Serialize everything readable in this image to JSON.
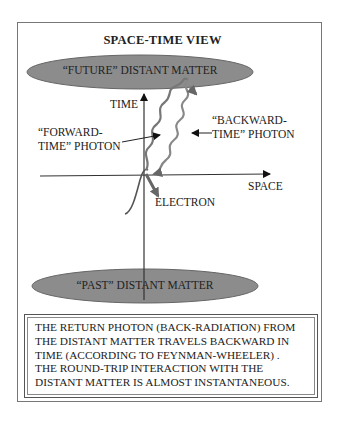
{
  "title": "SPACE-TIME VIEW",
  "ellipses": {
    "future": {
      "label": "“FUTURE” DISTANT MATTER",
      "fill": "#8c8c8c"
    },
    "past": {
      "label": "“PAST” DISTANT MATTER",
      "fill": "#8c8c8c"
    }
  },
  "axes": {
    "time_label": "TIME",
    "space_label": "SPACE"
  },
  "labels": {
    "forward_line1": "“FORWARD-",
    "forward_line2": "TIME” PHOTON",
    "backward_line1": "“BACKWARD-",
    "backward_line2": "TIME” PHOTON",
    "electron": "ELECTRON"
  },
  "note": {
    "lines": [
      "THE RETURN PHOTON  (BACK-RADIATION) FROM",
      "THE DISTANT MATTER TRAVELS BACKWARD IN",
      "TIME (ACCORDING TO FEYNMAN-WHEELER) .",
      "THE ROUND-TRIP INTERACTION WITH THE",
      "DISTANT MATTER IS ALMOST INSTANTANEOUS."
    ]
  },
  "colors": {
    "ellipse_fill": "#8c8c8c",
    "photon_stroke": "#777777",
    "arrow": "#111111"
  }
}
